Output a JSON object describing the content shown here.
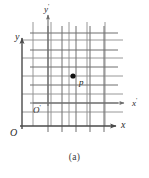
{
  "figure": {
    "caption": "(a)",
    "background_color": "#ffffff",
    "width": 149,
    "height": 178
  },
  "axes": {
    "x": {
      "label": "x",
      "prime": "",
      "label_x": 121,
      "label_y": 120,
      "color": "#4a4a4a",
      "start": [
        20,
        126
      ],
      "end": [
        116,
        126
      ]
    },
    "y": {
      "label": "y",
      "prime": "",
      "label_x": 15,
      "label_y": 32,
      "color": "#4a4a4a",
      "start": [
        22,
        129
      ],
      "end": [
        22,
        38
      ]
    },
    "x_prime": {
      "label": "x",
      "prime": "'",
      "label_x": 132,
      "label_y": 97,
      "color": "#6b6b6b",
      "start": [
        33,
        103
      ],
      "end": [
        124,
        103
      ]
    },
    "y_prime": {
      "label": "y",
      "prime": "'",
      "label_x": 44,
      "label_y": 3,
      "color": "#6b6b6b",
      "start": [
        48,
        106
      ],
      "end": [
        48,
        15
      ]
    }
  },
  "origins": {
    "o": {
      "label": "O",
      "label_x": 10,
      "label_y": 128
    },
    "o_prime": {
      "label": "O",
      "prime": "'",
      "label_x": 33,
      "label_y": 104
    }
  },
  "point": {
    "label": "p",
    "label_x": 79,
    "label_y": 77,
    "dot_x": 73,
    "dot_y": 76,
    "dot_radius": 2.6,
    "color": "#111111"
  },
  "grid": {
    "unprimed": {
      "color": "#8d8d8d",
      "stroke_width": 0.9,
      "vertical_x": [
        33,
        51,
        69,
        87,
        105
      ],
      "vertical_top": 22,
      "vertical_bottom": 126,
      "horizontal_y": [
        40,
        58,
        76,
        94,
        112
      ],
      "horizontal_left": 22,
      "horizontal_right": 123
    },
    "primed": {
      "color": "#6e6e6e",
      "stroke_width": 1.0,
      "vertical_x": [
        48,
        62,
        76,
        90,
        104
      ],
      "vertical_top": 26,
      "vertical_bottom": 132,
      "horizontal_y": [
        33,
        50,
        67,
        85,
        103
      ],
      "horizontal_left": 30,
      "horizontal_right": 118
    }
  },
  "chart_data": {
    "type": "scatter",
    "title": "(a)",
    "xlabel": "x",
    "ylabel": "y",
    "series": [
      {
        "name": "p",
        "points": [
          {
            "label": "p",
            "x_unprimed": 2.8,
            "y_unprimed": 2.8,
            "x_primed": 1.8,
            "y_primed": 1.6
          }
        ]
      }
    ],
    "frames": [
      {
        "name": "xy",
        "origin_label": "O",
        "x_axis_label": "x",
        "y_axis_label": "y",
        "grid_lines_x": 5,
        "grid_lines_y": 5
      },
      {
        "name": "x'y'",
        "origin_label": "O'",
        "x_axis_label": "x'",
        "y_axis_label": "y'",
        "grid_lines_x": 5,
        "grid_lines_y": 5
      }
    ],
    "grid": true,
    "legend": "none"
  }
}
